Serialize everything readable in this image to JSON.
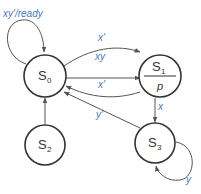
{
  "diagram": {
    "type": "state-machine",
    "colors": {
      "state_stroke": "#333333",
      "edge_stroke": "#555555",
      "edge_label": "#4a78b8"
    },
    "states": [
      {
        "id": "S0",
        "name": "S",
        "sub": "0",
        "output": ""
      },
      {
        "id": "S1",
        "name": "S",
        "sub": "1",
        "output": "p"
      },
      {
        "id": "S2",
        "name": "S",
        "sub": "2",
        "output": ""
      },
      {
        "id": "S3",
        "name": "S",
        "sub": "3",
        "output": ""
      }
    ],
    "transitions": [
      {
        "from": "S0",
        "to": "S0",
        "label": "xy'/ready"
      },
      {
        "from": "S0",
        "to": "S1",
        "label": "x'"
      },
      {
        "from": "S0",
        "to": "S1",
        "label": "xy"
      },
      {
        "from": "S1",
        "to": "S0",
        "label": "x'"
      },
      {
        "from": "S1",
        "to": "S3",
        "label": "x"
      },
      {
        "from": "S3",
        "to": "S0",
        "label": "y'"
      },
      {
        "from": "S3",
        "to": "S3",
        "label": "y"
      },
      {
        "from": "S2",
        "to": "S0",
        "label": ""
      }
    ]
  }
}
